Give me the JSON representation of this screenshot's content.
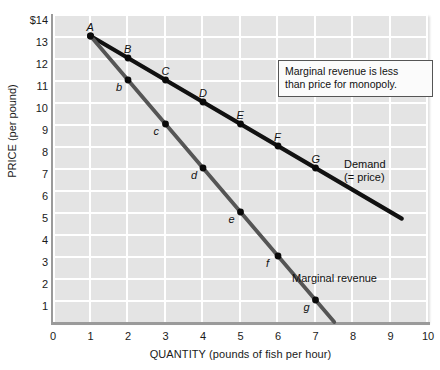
{
  "chart_data": {
    "type": "line",
    "title": "",
    "xlabel": "QUANTITY (pounds of fish per hour)",
    "ylabel": "PRICE (per pound)",
    "xlim": [
      0,
      10
    ],
    "ylim": [
      0,
      14
    ],
    "grid": true,
    "xticks": [
      "0",
      "1",
      "2",
      "3",
      "4",
      "5",
      "6",
      "7",
      "8",
      "9",
      "10"
    ],
    "yticks": [
      "$14",
      "13",
      "12",
      "11",
      "10",
      "9",
      "8",
      "7",
      "6",
      "5",
      "4",
      "3",
      "2",
      "1",
      "0"
    ],
    "legend_position": "inline-right",
    "series": [
      {
        "name": "Demand (= price)",
        "label_line1": "Demand",
        "label_line2": "(= price)",
        "color": "#111111",
        "x": [
          1,
          2,
          3,
          4,
          5,
          6,
          7
        ],
        "values": [
          13,
          12,
          11,
          10,
          9,
          8,
          7
        ],
        "point_labels": [
          "A",
          "B",
          "C",
          "D",
          "E",
          "F",
          "G"
        ],
        "extends_to": [
          9.3,
          4.7
        ]
      },
      {
        "name": "Marginal revenue",
        "label_line1": "Marginal revenue",
        "label_line2": "",
        "color": "#555555",
        "x": [
          1,
          2,
          3,
          4,
          5,
          6,
          7
        ],
        "values": [
          13,
          11,
          9,
          7,
          5,
          3,
          1
        ],
        "point_labels": [
          "A",
          "b",
          "c",
          "d",
          "e",
          "f",
          "g"
        ],
        "extends_to": [
          7.5,
          0
        ]
      }
    ],
    "annotations": [
      {
        "name": "callout",
        "line1": "Marginal revenue is less",
        "line2": "than price for monopoly."
      }
    ],
    "colors": {
      "plot_background": "#e4e4e4",
      "gridline": "#ffffff",
      "axis": "#9a9a9a",
      "demand_line": "#111111",
      "marginal_revenue_line": "#555555",
      "text": "#1a1a1a"
    }
  }
}
